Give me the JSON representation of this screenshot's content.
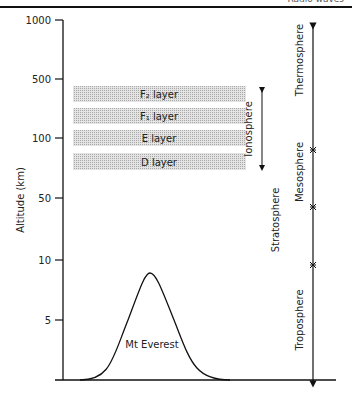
{
  "header": {
    "title": "Radio waves"
  },
  "axis": {
    "ylabel": "Altitude (km)",
    "ticks": [
      {
        "label": "1000",
        "y": 20
      },
      {
        "label": "500",
        "y": 79
      },
      {
        "label": "100",
        "y": 138
      },
      {
        "label": "50",
        "y": 198
      },
      {
        "label": "10",
        "y": 260
      },
      {
        "label": "5",
        "y": 320
      }
    ]
  },
  "ionosphere": {
    "label": "Ionosphere",
    "layers": [
      {
        "label": "F₂ layer",
        "y": 86,
        "h": 16
      },
      {
        "label": "F₁ layer",
        "y": 108,
        "h": 16
      },
      {
        "label": "E layer",
        "y": 130,
        "h": 16
      },
      {
        "label": "D layer",
        "y": 153,
        "h": 17
      }
    ]
  },
  "atmosphere": [
    {
      "label": "Thermosphere"
    },
    {
      "label": "Mesosphere"
    },
    {
      "label": "Stratosphere"
    },
    {
      "label": "Troposphere"
    }
  ],
  "mountain": {
    "label": "Mt Everest"
  }
}
